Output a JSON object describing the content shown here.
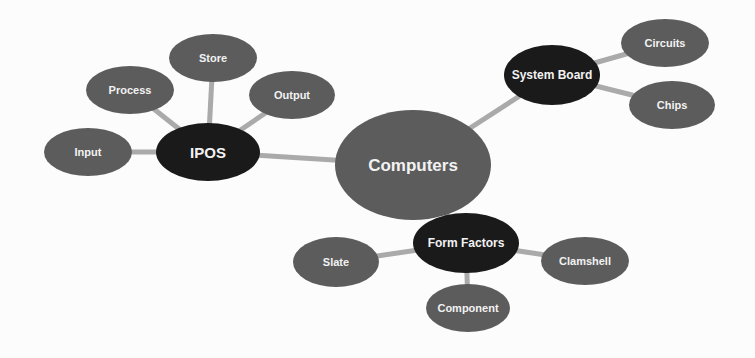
{
  "diagram": {
    "type": "mind-map",
    "colors": {
      "background": "#fcfcfc",
      "primary_node": "#5c5c5c",
      "hub_node": "#1a1a1a",
      "leaf_node": "#5c5c5c",
      "connector": "#aaaaaa",
      "label": "#f2f2f2"
    },
    "nodes": [
      {
        "id": "computers",
        "label": "Computers",
        "kind": "central",
        "cx": 413,
        "cy": 165,
        "rx": 78,
        "ry": 55,
        "font": 17
      },
      {
        "id": "ipos",
        "label": "IPOS",
        "kind": "hub",
        "cx": 208,
        "cy": 152,
        "rx": 52,
        "ry": 29,
        "font": 15
      },
      {
        "id": "input",
        "label": "Input",
        "kind": "leaf",
        "cx": 88,
        "cy": 152,
        "rx": 44,
        "ry": 24,
        "font": 11
      },
      {
        "id": "process",
        "label": "Process",
        "kind": "leaf",
        "cx": 130,
        "cy": 90,
        "rx": 44,
        "ry": 24,
        "font": 11
      },
      {
        "id": "store",
        "label": "Store",
        "kind": "leaf",
        "cx": 213,
        "cy": 58,
        "rx": 44,
        "ry": 24,
        "font": 11
      },
      {
        "id": "output",
        "label": "Output",
        "kind": "leaf",
        "cx": 292,
        "cy": 95,
        "rx": 43,
        "ry": 24,
        "font": 11
      },
      {
        "id": "system-board",
        "label": "System Board",
        "kind": "hub",
        "cx": 552,
        "cy": 75,
        "rx": 48,
        "ry": 30,
        "font": 12
      },
      {
        "id": "circuits",
        "label": "Circuits",
        "kind": "leaf",
        "cx": 665,
        "cy": 43,
        "rx": 44,
        "ry": 24,
        "font": 11
      },
      {
        "id": "chips",
        "label": "Chips",
        "kind": "leaf",
        "cx": 672,
        "cy": 105,
        "rx": 43,
        "ry": 24,
        "font": 11
      },
      {
        "id": "form-factors",
        "label": "Form Factors",
        "kind": "hub",
        "cx": 466,
        "cy": 243,
        "rx": 53,
        "ry": 30,
        "font": 12
      },
      {
        "id": "slate",
        "label": "Slate",
        "kind": "leaf",
        "cx": 336,
        "cy": 262,
        "rx": 43,
        "ry": 25,
        "font": 11
      },
      {
        "id": "clamshell",
        "label": "Clamshell",
        "kind": "leaf",
        "cx": 585,
        "cy": 261,
        "rx": 44,
        "ry": 24,
        "font": 11
      },
      {
        "id": "component",
        "label": "Component",
        "kind": "leaf",
        "cx": 468,
        "cy": 308,
        "rx": 42,
        "ry": 24,
        "font": 11
      }
    ],
    "edges": [
      {
        "from": "computers",
        "to": "ipos"
      },
      {
        "from": "computers",
        "to": "system-board"
      },
      {
        "from": "computers",
        "to": "form-factors"
      },
      {
        "from": "ipos",
        "to": "input"
      },
      {
        "from": "ipos",
        "to": "process"
      },
      {
        "from": "ipos",
        "to": "store"
      },
      {
        "from": "ipos",
        "to": "output"
      },
      {
        "from": "system-board",
        "to": "circuits"
      },
      {
        "from": "system-board",
        "to": "chips"
      },
      {
        "from": "form-factors",
        "to": "slate"
      },
      {
        "from": "form-factors",
        "to": "clamshell"
      },
      {
        "from": "form-factors",
        "to": "component"
      }
    ]
  }
}
